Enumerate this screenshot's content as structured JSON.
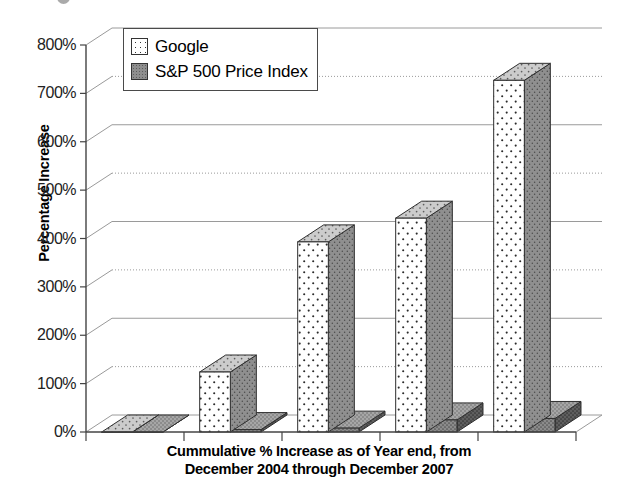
{
  "chart_data": {
    "type": "bar",
    "title": "",
    "subtitle": "",
    "xlabel_lines": [
      "Cummulative % Increase as of Year end, from",
      "December 2004 through December 2007"
    ],
    "ylabel": "Percentage Increase",
    "categories": [
      "",
      "",
      "",
      "",
      ""
    ],
    "yticks": [
      "0%",
      "100%",
      "200%",
      "300%",
      "400%",
      "500%",
      "600%",
      "700%",
      "800%"
    ],
    "ytick_values": [
      0,
      100,
      200,
      300,
      400,
      500,
      600,
      700,
      800
    ],
    "ylim": [
      0,
      800
    ],
    "grid": true,
    "legend_position": "top-left",
    "style": "3d-column",
    "series": [
      {
        "name": "Google",
        "color": "#ffffff",
        "pattern": "dotted",
        "values": [
          0,
          124,
          393,
          442,
          727
        ]
      },
      {
        "name": "S&P 500 Price Index",
        "color": "#8e8e8e",
        "pattern": "solid-gray",
        "values": [
          0,
          5,
          8,
          25,
          28
        ]
      }
    ]
  },
  "legend": {
    "items": [
      {
        "label": "Google",
        "swatch": "google-swatch"
      },
      {
        "label": "S&P 500 Price Index",
        "swatch": "sp500-swatch"
      }
    ]
  },
  "axes": {
    "y_title": "Percentage Increase",
    "x_title_line1": "Cummulative % Increase as of Year end, from",
    "x_title_line2": "December 2004 through December 2007"
  },
  "colors": {
    "google_face": "#ffffff",
    "google_side": "#8a8a8a",
    "google_top": "#c9c9c9",
    "sp_face": "#8e8e8e",
    "sp_side": "#5a5a5a",
    "sp_top": "#aaaaaa",
    "grid": "#9a9a9a",
    "axis": "#444444",
    "text": "#111111"
  }
}
